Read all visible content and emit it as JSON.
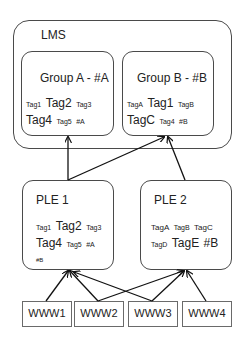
{
  "lms": {
    "title": "LMS"
  },
  "groups": [
    {
      "title": "Group A - #A",
      "tags_line1": [
        {
          "t": "Tag1",
          "s": "s"
        },
        {
          "t": "Tag2",
          "s": "l"
        },
        {
          "t": "Tag3",
          "s": "s"
        }
      ],
      "tags_line2": [
        {
          "t": "Tag4",
          "s": "l"
        },
        {
          "t": "Tag5",
          "s": "s"
        },
        {
          "t": "#A",
          "s": "s"
        }
      ]
    },
    {
      "title": "Group B - #B",
      "tags_line1": [
        {
          "t": "TagA",
          "s": "s"
        },
        {
          "t": "Tag1",
          "s": "l"
        },
        {
          "t": "TagB",
          "s": "s"
        }
      ],
      "tags_line2": [
        {
          "t": "TagC",
          "s": "l"
        },
        {
          "t": "Tag4",
          "s": "s"
        },
        {
          "t": "#B",
          "s": "s"
        }
      ]
    }
  ],
  "ples": [
    {
      "title": "PLE 1",
      "tags_line1": [
        {
          "t": "Tag1",
          "s": "s"
        },
        {
          "t": "Tag2",
          "s": "l"
        },
        {
          "t": "Tag3",
          "s": "s"
        }
      ],
      "tags_line2": [
        {
          "t": "Tag4",
          "s": "l"
        },
        {
          "t": "Tag5",
          "s": "s"
        },
        {
          "t": "#A",
          "s": "s"
        }
      ],
      "tags_line3": [
        {
          "t": "#B",
          "s": "xs"
        }
      ]
    },
    {
      "title": "PLE 2",
      "tags_line1": [
        {
          "t": "TagA",
          "s": "s"
        },
        {
          "t": "TagB",
          "s": "s"
        },
        {
          "t": "TagC",
          "s": "s"
        }
      ],
      "tags_line2": [
        {
          "t": "TagD",
          "s": "s"
        },
        {
          "t": "TagE",
          "s": "l"
        },
        {
          "t": "#B",
          "s": "l"
        }
      ]
    }
  ],
  "sources": [
    {
      "label": "WWW1"
    },
    {
      "label": "WWW2"
    },
    {
      "label": "WWW3"
    },
    {
      "label": "WWW4"
    }
  ],
  "edges": [
    {
      "from": "PLE 1",
      "to": "Group A - #A"
    },
    {
      "from": "PLE 1",
      "to": "Group B - #B"
    },
    {
      "from": "PLE 2",
      "to": "Group B - #B"
    },
    {
      "from": "WWW1",
      "to": "PLE 1"
    },
    {
      "from": "WWW2",
      "to": "PLE 1"
    },
    {
      "from": "WWW2",
      "to": "PLE 2"
    },
    {
      "from": "WWW3",
      "to": "PLE 1"
    },
    {
      "from": "WWW3",
      "to": "PLE 2"
    },
    {
      "from": "WWW4",
      "to": "PLE 2"
    }
  ],
  "colors": {
    "stroke": "#4a4a4a",
    "arrow": "#111111",
    "text": "#222222"
  }
}
